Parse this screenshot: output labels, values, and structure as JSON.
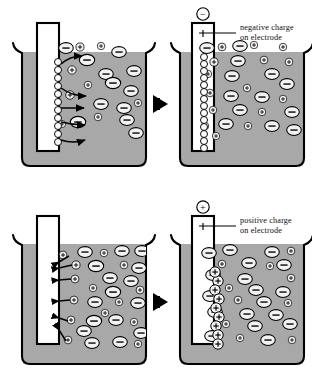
{
  "figure": {
    "type": "scientific-diagram",
    "background_color": "#ffffff",
    "solution_color": "#a8a8a8",
    "electrode_color": "#ffffff",
    "outline_color": "#000000",
    "ion_fill": "#f2f2f2"
  },
  "panels": [
    {
      "id": "top-left",
      "row": "negative",
      "stage": "before",
      "electrode_charge": null,
      "electrode_charge_symbol": null,
      "label": null,
      "surface_particle_count": 9,
      "surface_particle_type": "neutral",
      "arrow_style": "curved",
      "arrow_direction": "away-from-electrode",
      "arrow_count": 4
    },
    {
      "id": "top-right",
      "row": "negative",
      "stage": "after",
      "electrode_charge": "negative",
      "electrode_charge_symbol": "−",
      "label": {
        "line1": "negative charge",
        "line2": "on electrode"
      },
      "surface_particle_count": 14,
      "surface_particle_type": "neutral",
      "arrow_style": "none",
      "arrow_direction": null,
      "arrow_count": 0
    },
    {
      "id": "bottom-left",
      "row": "positive",
      "stage": "before",
      "electrode_charge": null,
      "electrode_charge_symbol": null,
      "label": null,
      "surface_particle_count": 0,
      "surface_particle_type": null,
      "arrow_style": "straight",
      "arrow_direction": "toward-electrode",
      "arrow_count": 6
    },
    {
      "id": "bottom-right",
      "row": "positive",
      "stage": "after",
      "electrode_charge": "positive",
      "electrode_charge_symbol": "+",
      "label": {
        "line1": "positive charge",
        "line2": "on electrode"
      },
      "surface_particle_count": 9,
      "surface_particle_type": "positive-ion",
      "arrow_style": "none",
      "arrow_direction": null,
      "arrow_count": 0
    }
  ],
  "transition_arrows": [
    {
      "id": "top-transition",
      "direction": "right",
      "color": "#000000"
    },
    {
      "id": "bottom-transition",
      "direction": "right",
      "color": "#000000"
    }
  ],
  "ion_legend": {
    "negative_ion": {
      "symbol": "−",
      "shape": "ellipse",
      "size": "large"
    },
    "positive_ion": {
      "symbol": "+",
      "shape": "circle",
      "size": "small"
    }
  },
  "ions": {
    "top_left": [
      {
        "t": "n",
        "x": 66,
        "y": 48,
        "s": 1.0
      },
      {
        "t": "p",
        "x": 80,
        "y": 47,
        "s": 0.78
      },
      {
        "t": "p",
        "x": 101,
        "y": 46,
        "s": 0.72
      },
      {
        "t": "n",
        "x": 119,
        "y": 52,
        "s": 1.0
      },
      {
        "t": "n",
        "x": 87,
        "y": 60,
        "s": 1.05
      },
      {
        "t": "p",
        "x": 72,
        "y": 70,
        "s": 0.8
      },
      {
        "t": "n",
        "x": 106,
        "y": 74,
        "s": 1.0
      },
      {
        "t": "n",
        "x": 134,
        "y": 71,
        "s": 1.0
      },
      {
        "t": "p",
        "x": 88,
        "y": 85,
        "s": 0.72
      },
      {
        "t": "n",
        "x": 113,
        "y": 83,
        "s": 1.05
      },
      {
        "t": "p",
        "x": 70,
        "y": 95,
        "s": 0.82
      },
      {
        "t": "n",
        "x": 131,
        "y": 91,
        "s": 1.0
      },
      {
        "t": "n",
        "x": 101,
        "y": 104,
        "s": 1.0
      },
      {
        "t": "n",
        "x": 124,
        "y": 108,
        "s": 1.0
      },
      {
        "t": "p",
        "x": 138,
        "y": 103,
        "s": 0.72
      },
      {
        "t": "p",
        "x": 98,
        "y": 117,
        "s": 0.72
      },
      {
        "t": "n",
        "x": 127,
        "y": 120,
        "s": 1.0
      },
      {
        "t": "p",
        "x": 62,
        "y": 124,
        "s": 0.7
      },
      {
        "t": "n",
        "x": 78,
        "y": 122,
        "s": 1.05
      },
      {
        "t": "n",
        "x": 136,
        "y": 133,
        "s": 1.0
      }
    ],
    "top_right": [
      {
        "t": "n",
        "x": 207,
        "y": 48,
        "s": 1.0
      },
      {
        "t": "p",
        "x": 222,
        "y": 47,
        "s": 0.75
      },
      {
        "t": "n",
        "x": 240,
        "y": 46,
        "s": 1.0
      },
      {
        "t": "p",
        "x": 254,
        "y": 45,
        "s": 0.72
      },
      {
        "t": "p",
        "x": 283,
        "y": 47,
        "s": 0.72
      },
      {
        "t": "p",
        "x": 214,
        "y": 62,
        "s": 0.78
      },
      {
        "t": "n",
        "x": 238,
        "y": 61,
        "s": 1.0
      },
      {
        "t": "p",
        "x": 264,
        "y": 60,
        "s": 0.74
      },
      {
        "t": "p",
        "x": 289,
        "y": 62,
        "s": 0.74
      },
      {
        "t": "p",
        "x": 208,
        "y": 74,
        "s": 0.72
      },
      {
        "t": "n",
        "x": 232,
        "y": 76,
        "s": 1.0
      },
      {
        "t": "n",
        "x": 272,
        "y": 74,
        "s": 1.0
      },
      {
        "t": "p",
        "x": 247,
        "y": 88,
        "s": 0.72
      },
      {
        "t": "n",
        "x": 287,
        "y": 84,
        "s": 1.0
      },
      {
        "t": "p",
        "x": 210,
        "y": 93,
        "s": 0.74
      },
      {
        "t": "n",
        "x": 231,
        "y": 96,
        "s": 1.0
      },
      {
        "t": "n",
        "x": 262,
        "y": 97,
        "s": 1.0
      },
      {
        "t": "p",
        "x": 283,
        "y": 99,
        "s": 0.72
      },
      {
        "t": "p",
        "x": 213,
        "y": 110,
        "s": 0.72
      },
      {
        "t": "n",
        "x": 240,
        "y": 110,
        "s": 1.0
      },
      {
        "t": "p",
        "x": 262,
        "y": 112,
        "s": 0.72
      },
      {
        "t": "n",
        "x": 292,
        "y": 112,
        "s": 1.0
      },
      {
        "t": "p",
        "x": 205,
        "y": 126,
        "s": 0.72
      },
      {
        "t": "n",
        "x": 226,
        "y": 124,
        "s": 1.0
      },
      {
        "t": "p",
        "x": 248,
        "y": 126,
        "s": 0.72
      },
      {
        "t": "n",
        "x": 272,
        "y": 126,
        "s": 1.0
      },
      {
        "t": "n",
        "x": 294,
        "y": 130,
        "s": 1.0
      },
      {
        "t": "p",
        "x": 216,
        "y": 136,
        "s": 0.7
      }
    ],
    "bottom_left": [
      {
        "t": "p",
        "x": 63,
        "y": 255,
        "s": 0.76
      },
      {
        "t": "n",
        "x": 85,
        "y": 252,
        "s": 1.0
      },
      {
        "t": "p",
        "x": 104,
        "y": 253,
        "s": 0.72
      },
      {
        "t": "n",
        "x": 122,
        "y": 251,
        "s": 1.0
      },
      {
        "t": "n",
        "x": 142,
        "y": 251,
        "s": 1.0
      },
      {
        "t": "p",
        "x": 76,
        "y": 265,
        "s": 0.78
      },
      {
        "t": "n",
        "x": 96,
        "y": 266,
        "s": 1.05
      },
      {
        "t": "p",
        "x": 124,
        "y": 265,
        "s": 0.74
      },
      {
        "t": "n",
        "x": 139,
        "y": 268,
        "s": 1.0
      },
      {
        "t": "p",
        "x": 75,
        "y": 279,
        "s": 0.76
      },
      {
        "t": "n",
        "x": 110,
        "y": 278,
        "s": 1.0
      },
      {
        "t": "n",
        "x": 131,
        "y": 281,
        "s": 1.0
      },
      {
        "t": "p",
        "x": 93,
        "y": 288,
        "s": 0.72
      },
      {
        "t": "n",
        "x": 113,
        "y": 292,
        "s": 1.05
      },
      {
        "t": "p",
        "x": 140,
        "y": 290,
        "s": 0.76
      },
      {
        "t": "p",
        "x": 74,
        "y": 300,
        "s": 0.76
      },
      {
        "t": "n",
        "x": 95,
        "y": 302,
        "s": 1.0
      },
      {
        "t": "p",
        "x": 119,
        "y": 302,
        "s": 0.72
      },
      {
        "t": "n",
        "x": 138,
        "y": 303,
        "s": 1.0
      },
      {
        "t": "p",
        "x": 105,
        "y": 313,
        "s": 0.72
      },
      {
        "t": "p",
        "x": 71,
        "y": 320,
        "s": 0.76
      },
      {
        "t": "n",
        "x": 94,
        "y": 321,
        "s": 1.05
      },
      {
        "t": "n",
        "x": 116,
        "y": 320,
        "s": 1.0
      },
      {
        "t": "p",
        "x": 134,
        "y": 322,
        "s": 0.72
      },
      {
        "t": "n",
        "x": 84,
        "y": 331,
        "s": 1.0
      },
      {
        "t": "n",
        "x": 141,
        "y": 333,
        "s": 1.0
      },
      {
        "t": "p",
        "x": 68,
        "y": 340,
        "s": 0.74
      },
      {
        "t": "n",
        "x": 92,
        "y": 343,
        "s": 1.0
      },
      {
        "t": "n",
        "x": 120,
        "y": 342,
        "s": 1.0
      },
      {
        "t": "p",
        "x": 138,
        "y": 344,
        "s": 0.72
      }
    ],
    "bottom_right": [
      {
        "t": "n",
        "x": 209,
        "y": 253,
        "s": 1.0
      },
      {
        "t": "n",
        "x": 230,
        "y": 250,
        "s": 1.0
      },
      {
        "t": "n",
        "x": 272,
        "y": 252,
        "s": 1.0
      },
      {
        "t": "p",
        "x": 291,
        "y": 251,
        "s": 0.74
      },
      {
        "t": "p",
        "x": 222,
        "y": 264,
        "s": 0.74
      },
      {
        "t": "n",
        "x": 249,
        "y": 263,
        "s": 1.0
      },
      {
        "t": "n",
        "x": 284,
        "y": 265,
        "s": 1.0
      },
      {
        "t": "p",
        "x": 270,
        "y": 266,
        "s": 0.72
      },
      {
        "t": "n",
        "x": 213,
        "y": 275,
        "s": 1.0
      },
      {
        "t": "n",
        "x": 245,
        "y": 279,
        "s": 1.0
      },
      {
        "t": "p",
        "x": 291,
        "y": 278,
        "s": 0.74
      },
      {
        "t": "p",
        "x": 229,
        "y": 288,
        "s": 0.72
      },
      {
        "t": "n",
        "x": 256,
        "y": 290,
        "s": 1.0
      },
      {
        "t": "n",
        "x": 283,
        "y": 292,
        "s": 1.0
      },
      {
        "t": "n",
        "x": 210,
        "y": 296,
        "s": 1.0
      },
      {
        "t": "p",
        "x": 238,
        "y": 300,
        "s": 0.74
      },
      {
        "t": "n",
        "x": 264,
        "y": 302,
        "s": 1.0
      },
      {
        "t": "p",
        "x": 288,
        "y": 303,
        "s": 0.72
      },
      {
        "t": "n",
        "x": 215,
        "y": 312,
        "s": 1.0
      },
      {
        "t": "n",
        "x": 247,
        "y": 314,
        "s": 1.0
      },
      {
        "t": "n",
        "x": 276,
        "y": 315,
        "s": 1.0
      },
      {
        "t": "p",
        "x": 226,
        "y": 324,
        "s": 0.72
      },
      {
        "t": "n",
        "x": 255,
        "y": 326,
        "s": 1.0
      },
      {
        "t": "n",
        "x": 290,
        "y": 324,
        "s": 1.0
      },
      {
        "t": "n",
        "x": 212,
        "y": 336,
        "s": 1.0
      },
      {
        "t": "p",
        "x": 240,
        "y": 338,
        "s": 0.72
      },
      {
        "t": "n",
        "x": 268,
        "y": 340,
        "s": 1.0
      },
      {
        "t": "p",
        "x": 292,
        "y": 340,
        "s": 0.72
      }
    ]
  }
}
